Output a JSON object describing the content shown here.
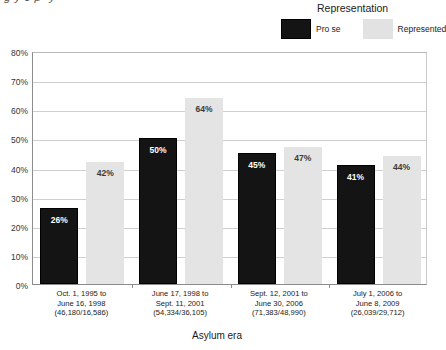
{
  "title": "-g-y-J-p--y-",
  "legend": {
    "title": "Representation",
    "items": [
      {
        "label": "Pro se",
        "color": "#141414"
      },
      {
        "label": "Represented",
        "color": "#e2e2e2"
      }
    ]
  },
  "axis": {
    "xlabel": "Asylum era",
    "ylabel": "",
    "yticks": [
      "0%",
      "10%",
      "20%",
      "30%",
      "40%",
      "50%",
      "60%",
      "70%",
      "80%"
    ]
  },
  "chart_data": {
    "type": "bar",
    "title": "",
    "xlabel": "Asylum era",
    "ylabel": "",
    "ylim": [
      0,
      80
    ],
    "ytick_values": [
      0,
      10,
      20,
      30,
      40,
      50,
      60,
      70,
      80
    ],
    "ytick_labels": [
      "0%",
      "10%",
      "20%",
      "30%",
      "40%",
      "50%",
      "60%",
      "70%",
      "80%"
    ],
    "grid": true,
    "legend_position": "top-right",
    "legend_title": "Representation",
    "categories": [
      "Oct. 1, 1995 to June 16, 1998 (46,180/16,586)",
      "June 17, 1998 to Sept. 11, 2001 (54,334/36,105)",
      "Sept. 12, 2001 to June 30, 2006 (71,383/48,990)",
      "July 1, 2006 to June 8, 2009 (26,039/29,712)"
    ],
    "category_lines": [
      [
        "Oct. 1, 1995 to",
        "June 16, 1998",
        "(46,180/16,586)"
      ],
      [
        "June 17, 1998 to",
        "Sept. 11, 2001",
        "(54,334/36,105)"
      ],
      [
        "Sept. 12, 2001 to",
        "June 30, 2006",
        "(71,383/48,990)"
      ],
      [
        "July 1, 2006 to",
        "June 8, 2009",
        "(26,039/29,712)"
      ]
    ],
    "series": [
      {
        "name": "Pro se",
        "color": "#141414",
        "values": [
          26,
          50,
          45,
          41
        ],
        "labels": [
          "26%",
          "50%",
          "45%",
          "41%"
        ]
      },
      {
        "name": "Represented",
        "color": "#e4e4e4",
        "values": [
          42,
          64,
          47,
          44
        ],
        "labels": [
          "42%",
          "64%",
          "47%",
          "44%"
        ]
      }
    ]
  }
}
